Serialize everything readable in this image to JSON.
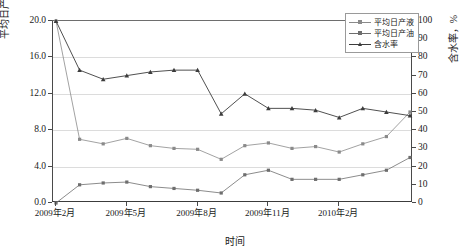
{
  "chart_data": {
    "type": "line",
    "title": "",
    "xlabel": "时间",
    "ylabel": "平均日产液（油），t",
    "y2label": "含水率，%",
    "ylim": [
      0,
      20
    ],
    "y2lim": [
      0,
      100
    ],
    "grid": true,
    "legend_position": "top-right",
    "x": [
      "2009年2月",
      "2009年3月",
      "2009年4月",
      "2009年5月",
      "2009年6月",
      "2009年7月",
      "2009年8月",
      "2009年9月",
      "2009年10月",
      "2009年11月",
      "2009年12月",
      "2010年1月",
      "2010年2月",
      "2010年3月",
      "2010年4月",
      "2010年5月"
    ],
    "xtick_labels": [
      "2009年2月",
      "2009年5月",
      "2009年8月",
      "2009年11月",
      "2010年2月"
    ],
    "xtick_indices": [
      0,
      3,
      6,
      9,
      12
    ],
    "ytick_labels": [
      "0.0",
      "4.0",
      "8.0",
      "12.0",
      "16.0",
      "20.0"
    ],
    "ytick_values": [
      0,
      4,
      8,
      12,
      16,
      20
    ],
    "y2tick_labels": [
      "0",
      "10",
      "20",
      "30",
      "40",
      "50",
      "60",
      "70",
      "80",
      "90",
      "100"
    ],
    "y2tick_values": [
      0,
      10,
      20,
      30,
      40,
      50,
      60,
      70,
      80,
      90,
      100
    ],
    "series": [
      {
        "name": "平均日产液",
        "axis": "left",
        "unit": "t",
        "color": "#8a8a8a",
        "marker": "square",
        "values": [
          20.0,
          7.0,
          6.5,
          7.1,
          6.3,
          6.0,
          5.9,
          4.8,
          6.3,
          6.6,
          6.0,
          6.2,
          5.6,
          6.5,
          7.3,
          10.0
        ]
      },
      {
        "name": "平均日产油",
        "axis": "left",
        "unit": "t",
        "color": "#6e6e6e",
        "marker": "square",
        "values": [
          0.0,
          2.0,
          2.2,
          2.3,
          1.8,
          1.6,
          1.4,
          1.1,
          3.1,
          3.6,
          2.6,
          2.6,
          2.6,
          3.1,
          3.6,
          5.0
        ]
      },
      {
        "name": "含水率",
        "axis": "right",
        "unit": "%",
        "color": "#3c3c3c",
        "marker": "triangle",
        "values": [
          100,
          73,
          68,
          70,
          72,
          73,
          73,
          49,
          60,
          52,
          52,
          51,
          47,
          52,
          50,
          48
        ]
      }
    ]
  }
}
